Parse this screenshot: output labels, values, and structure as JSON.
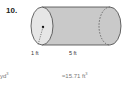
{
  "problem": {
    "number": "10.",
    "radius_label": "1 ft",
    "length_label": "5 ft"
  },
  "answers": {
    "left_unit": "yd",
    "left_exp": "3",
    "right_value": "≈15.71 ft",
    "right_exp": "3"
  },
  "colors": {
    "cylinder_fill": "#c9c9c9",
    "cylinder_end": "#e6e6e6",
    "outline": "#444444"
  }
}
